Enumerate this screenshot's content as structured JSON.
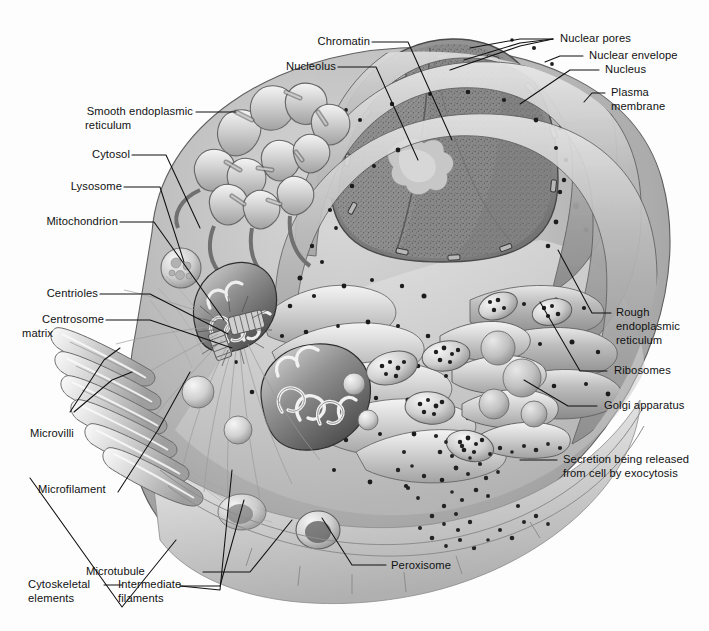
{
  "figure": {
    "kind": "animal-cell-diagram",
    "width": 709,
    "height": 631,
    "background": "#fdfdfd",
    "ink": "#111111"
  },
  "labels": {
    "chromatin": "Chromatin",
    "nucleolus": "Nucleolus",
    "nuclear_pores": "Nuclear pores",
    "nuclear_envelope": "Nuclear envelope",
    "nucleus": "Nucleus",
    "plasma_membrane_l1": "Plasma",
    "plasma_membrane_l2": "membrane",
    "smooth_er_l1": "Smooth endoplasmic",
    "smooth_er_l2": "reticulum",
    "cytosol": "Cytosol",
    "lysosome": "Lysosome",
    "mitochondrion": "Mitochondrion",
    "centrioles": "Centrioles",
    "centrosome_l1": "Centrosome",
    "centrosome_l2": "matrix",
    "microvilli": "Microvilli",
    "microfilament": "Microfilament",
    "microtubule": "Microtubule",
    "cytoskeletal_l1": "Cytoskeletal",
    "cytoskeletal_l2": "elements",
    "intermediate_l1": "Intermediate",
    "intermediate_l2": "filaments",
    "peroxisome": "Peroxisome",
    "rough_er_l1": "Rough",
    "rough_er_l2": "endoplasmic",
    "rough_er_l3": "reticulum",
    "ribosomes": "Ribosomes",
    "golgi": "Golgi apparatus",
    "secretion_l1": "Secretion being released",
    "secretion_l2": "from cell by exocytosis"
  },
  "colors": {
    "cytoplasm_light": "#cfcfcf",
    "cytoplasm_mid": "#a8a8a8",
    "cytoplasm_dark": "#7a7a7a",
    "membrane_pale": "#e6e6e6",
    "nucleus_fill": "#8c8c8c",
    "ribosome_dot": "#24241f",
    "leader_line": "#111111"
  }
}
